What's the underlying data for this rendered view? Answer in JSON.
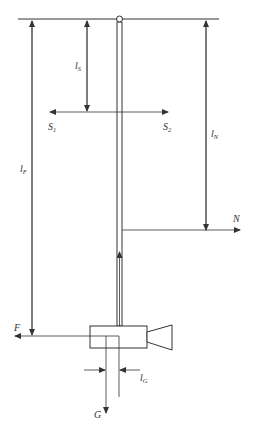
{
  "diagram": {
    "title": "",
    "labels": {
      "ls": {
        "main": "l",
        "sub": "S"
      },
      "s1": {
        "main": "S",
        "sub": "1"
      },
      "s2": {
        "main": "S",
        "sub": "2"
      },
      "ln": {
        "main": "l",
        "sub": "N"
      },
      "lf": {
        "main": "l",
        "sub": "F"
      },
      "n": "N",
      "f": "F",
      "lg": {
        "main": "l",
        "sub": "G"
      },
      "g": "G"
    },
    "colors": {
      "line": "#333333",
      "fill": "#ffffff"
    }
  }
}
